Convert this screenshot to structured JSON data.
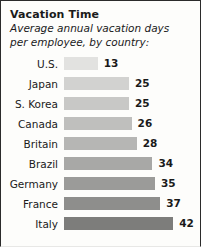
{
  "chart_data": {
    "type": "bar",
    "orientation": "horizontal",
    "title": "Vacation Time",
    "subtitle": "Average annual vacation days per employee, by country:",
    "subtitle_line1": "Average annual vacation days",
    "subtitle_line2": "per employee, by country:",
    "xlabel": "",
    "ylabel": "",
    "xlim": [
      0,
      42
    ],
    "grid": false,
    "legend": "none",
    "categories": [
      "U.S.",
      "Japan",
      "S. Korea",
      "Canada",
      "Britain",
      "Brazil",
      "Germany",
      "France",
      "Italy"
    ],
    "values": [
      13,
      25,
      25,
      26,
      28,
      34,
      35,
      37,
      42
    ],
    "bar_colors": [
      "#e2e2e0",
      "#d2d2d0",
      "#c8c8c6",
      "#bfbfbd",
      "#b6b6b4",
      "#a8a8a6",
      "#9b9b99",
      "#8e8e8c",
      "#7d7d7b"
    ],
    "rows": [
      {
        "country": "U.S.",
        "value": 13,
        "value_text": "13",
        "color": "#e2e2e0"
      },
      {
        "country": "Japan",
        "value": 25,
        "value_text": "25",
        "color": "#d2d2d0"
      },
      {
        "country": "S. Korea",
        "value": 25,
        "value_text": "25",
        "color": "#c8c8c6"
      },
      {
        "country": "Canada",
        "value": 26,
        "value_text": "26",
        "color": "#bfbfbd"
      },
      {
        "country": "Britain",
        "value": 28,
        "value_text": "28",
        "color": "#b6b6b4"
      },
      {
        "country": "Brazil",
        "value": 34,
        "value_text": "34",
        "color": "#a8a8a6"
      },
      {
        "country": "Germany",
        "value": 35,
        "value_text": "35",
        "color": "#9b9b99"
      },
      {
        "country": "France",
        "value": 37,
        "value_text": "37",
        "color": "#8e8e8c"
      },
      {
        "country": "Italy",
        "value": 42,
        "value_text": "42",
        "color": "#7d7d7b"
      }
    ]
  },
  "style": {
    "background": "#fdfdfb",
    "border_color": "#2b2b2b",
    "text_color": "#1a1a1a",
    "px_per_unit": 2.6
  }
}
